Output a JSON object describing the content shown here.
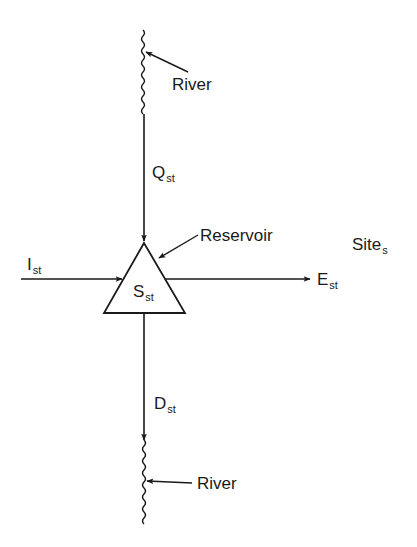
{
  "diagram": {
    "type": "reservoir-flow-schematic",
    "site_label": {
      "text": "Site",
      "subscript": "s"
    },
    "reservoir": {
      "callout": "Reservoir",
      "storage": {
        "symbol": "S",
        "subscript": "st"
      }
    },
    "flows": {
      "inflow_upstream": {
        "symbol": "Q",
        "subscript": "st",
        "direction": "down"
      },
      "lateral_inflow": {
        "symbol": "I",
        "subscript": "st",
        "direction": "right"
      },
      "evaporation": {
        "symbol": "E",
        "subscript": "st",
        "direction": "right"
      },
      "release": {
        "symbol": "D",
        "subscript": "st",
        "direction": "down"
      }
    },
    "rivers": {
      "upstream": {
        "label": "River"
      },
      "downstream": {
        "label": "River"
      }
    },
    "colors": {
      "stroke": "#1a1a1a",
      "background": "#ffffff"
    }
  }
}
